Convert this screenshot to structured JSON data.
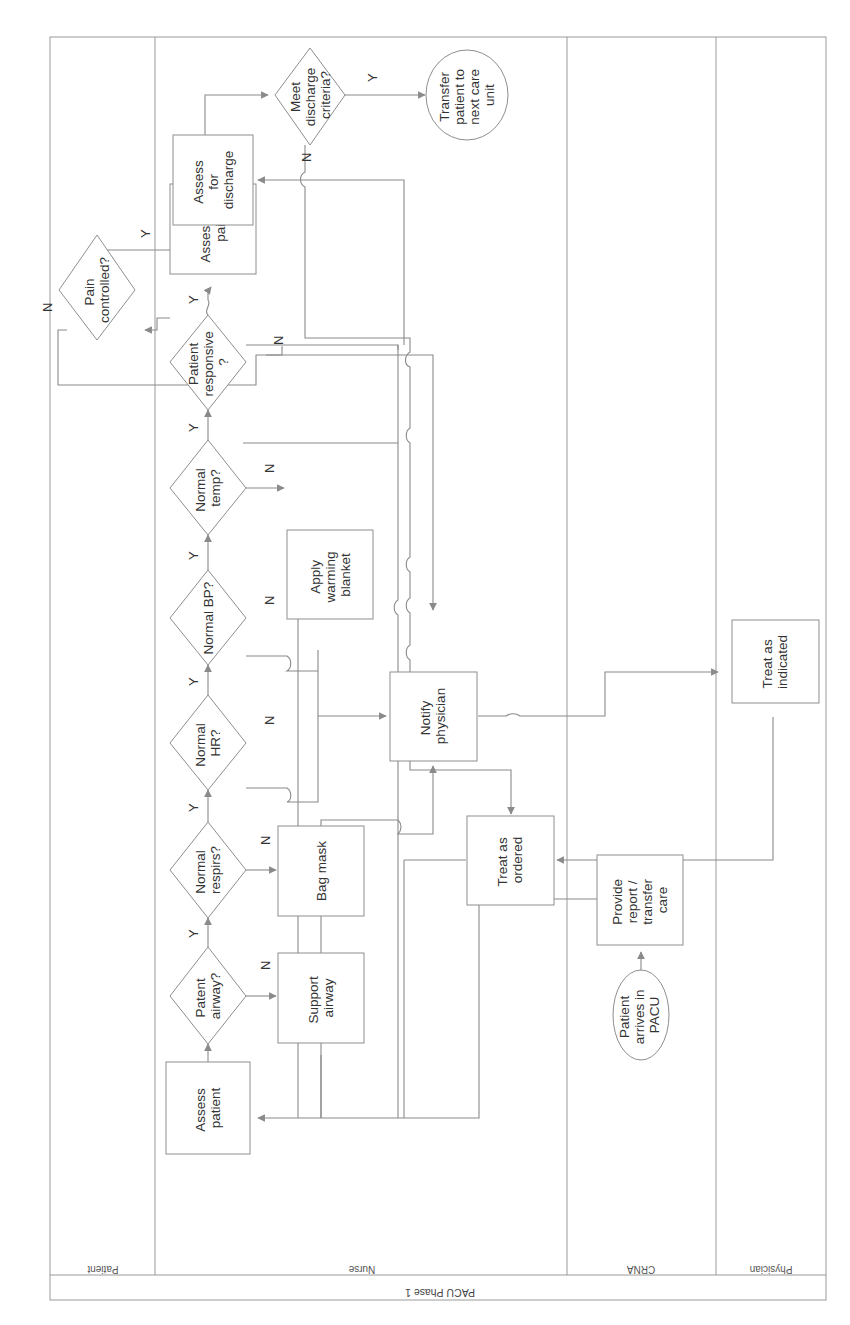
{
  "diagram": {
    "title": "PACU Phase 1",
    "orientation": "rotated 90 degrees clockwise",
    "lanes": [
      {
        "id": "patient",
        "label": "Patient"
      },
      {
        "id": "nurse",
        "label": "Nurse"
      },
      {
        "id": "crna",
        "label": "CRNA"
      },
      {
        "id": "physician",
        "label": "Physician"
      }
    ],
    "nodes": {
      "start": {
        "type": "terminator",
        "lane": "crna",
        "lines": [
          "Patient",
          "arrives in",
          "PACU"
        ]
      },
      "provide_report": {
        "type": "process",
        "lane": "crna",
        "lines": [
          "Provide",
          "report /",
          "transfer",
          "care"
        ]
      },
      "assess_patient": {
        "type": "process",
        "lane": "nurse",
        "lines": [
          "Assess",
          "patient"
        ]
      },
      "patent_airway": {
        "type": "decision",
        "lane": "nurse",
        "lines": [
          "Patent",
          "airway?"
        ]
      },
      "support_airway": {
        "type": "process",
        "lane": "nurse",
        "lines": [
          "Support",
          "airway"
        ]
      },
      "normal_respirs": {
        "type": "decision",
        "lane": "nurse",
        "lines": [
          "Normal",
          "respirs?"
        ]
      },
      "bag_mask": {
        "type": "process",
        "lane": "nurse",
        "lines": [
          "Bag mask"
        ]
      },
      "normal_hr": {
        "type": "decision",
        "lane": "nurse",
        "lines": [
          "Normal",
          "HR?"
        ]
      },
      "normal_bp": {
        "type": "decision",
        "lane": "nurse",
        "lines": [
          "Normal BP?"
        ]
      },
      "normal_temp": {
        "type": "decision",
        "lane": "nurse",
        "lines": [
          "Normal",
          "temp?"
        ]
      },
      "apply_warming": {
        "type": "process",
        "lane": "nurse",
        "lines": [
          "Apply",
          "warming",
          "blanket"
        ]
      },
      "patient_responsive": {
        "type": "decision",
        "lane": "nurse",
        "lines": [
          "Patient",
          "responsive",
          "?"
        ]
      },
      "assess_pain": {
        "type": "process",
        "lane": "nurse",
        "lines": [
          "Assess for",
          "pain"
        ]
      },
      "pain_controlled": {
        "type": "decision",
        "lane": "patient",
        "lines": [
          "Pain",
          "controlled?"
        ]
      },
      "assess_discharge": {
        "type": "process",
        "lane": "nurse",
        "lines": [
          "Assess",
          "for",
          "discharge"
        ]
      },
      "meet_discharge": {
        "type": "decision",
        "lane": "nurse",
        "lines": [
          "Meet",
          "discharge",
          "criteria?"
        ]
      },
      "transfer_patient": {
        "type": "terminator",
        "lane": "nurse",
        "lines": [
          "Transfer",
          "patient to",
          "next care",
          "unit"
        ]
      },
      "notify_physician": {
        "type": "process",
        "lane": "nurse",
        "lines": [
          "Notify",
          "physician"
        ]
      },
      "treat_ordered": {
        "type": "process",
        "lane": "nurse",
        "lines": [
          "Treat as",
          "ordered"
        ]
      },
      "treat_indicated": {
        "type": "process",
        "lane": "physician",
        "lines": [
          "Treat as",
          "indicated"
        ]
      }
    },
    "edge_labels": {
      "yes": "Y",
      "no": "N"
    },
    "edges": [
      {
        "from": "start",
        "to": "provide_report"
      },
      {
        "from": "provide_report",
        "to": "assess_patient"
      },
      {
        "from": "assess_patient",
        "to": "patent_airway"
      },
      {
        "from": "patent_airway",
        "to": "normal_respirs",
        "label": "Y"
      },
      {
        "from": "patent_airway",
        "to": "support_airway",
        "label": "N"
      },
      {
        "from": "normal_respirs",
        "to": "normal_hr",
        "label": "Y"
      },
      {
        "from": "normal_respirs",
        "to": "bag_mask",
        "label": "N"
      },
      {
        "from": "normal_hr",
        "to": "normal_bp",
        "label": "Y"
      },
      {
        "from": "normal_hr",
        "to": "notify_physician",
        "label": "N"
      },
      {
        "from": "normal_bp",
        "to": "normal_temp",
        "label": "Y"
      },
      {
        "from": "normal_bp",
        "to": "notify_physician",
        "label": "N"
      },
      {
        "from": "normal_temp",
        "to": "patient_responsive",
        "label": "Y"
      },
      {
        "from": "normal_temp",
        "to": "apply_warming",
        "label": "N"
      },
      {
        "from": "patient_responsive",
        "to": "assess_pain",
        "label": "Y"
      },
      {
        "from": "patient_responsive",
        "to": "notify_physician",
        "label": "N"
      },
      {
        "from": "assess_pain",
        "to": "pain_controlled"
      },
      {
        "from": "pain_controlled",
        "to": "assess_discharge",
        "label": "Y"
      },
      {
        "from": "pain_controlled",
        "to": "assess_pain",
        "label": "N"
      },
      {
        "from": "assess_discharge",
        "to": "meet_discharge"
      },
      {
        "from": "meet_discharge",
        "to": "transfer_patient",
        "label": "Y"
      },
      {
        "from": "meet_discharge",
        "to": "treat_ordered",
        "label": "N"
      },
      {
        "from": "notify_physician",
        "to": "treat_indicated"
      },
      {
        "from": "treat_indicated",
        "to": "treat_ordered"
      },
      {
        "from": "support_airway",
        "to": "assess_patient"
      },
      {
        "from": "bag_mask",
        "to": "assess_patient"
      },
      {
        "from": "apply_warming",
        "to": "assess_patient"
      },
      {
        "from": "treat_ordered",
        "to": "assess_patient"
      }
    ]
  }
}
